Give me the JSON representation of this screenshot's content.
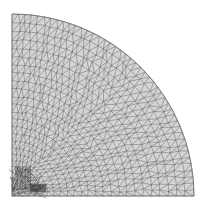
{
  "figure": {
    "title": "Quarter-disk triangular finite element mesh",
    "shape": "quarter-circle",
    "center_px": [
      12,
      196
    ],
    "radius_px": 182,
    "radial_rings": 26,
    "angular_divisions_outer": 44,
    "refinement_zone": "bottom-left corner (origin)",
    "colors": {
      "background": "#ffffff",
      "fill": "#d4d4d4",
      "edge": "#5a5a5a",
      "dense_core": "#3a3a3a"
    }
  }
}
